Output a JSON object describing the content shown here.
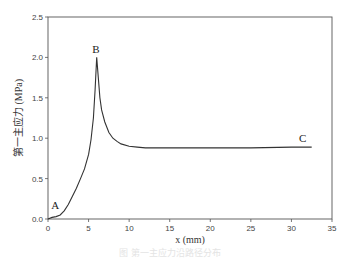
{
  "chart_data": {
    "type": "line",
    "title": "",
    "xlabel": "x (mm)",
    "ylabel": "第一主应力 (MPa)",
    "xlim": [
      0,
      35
    ],
    "ylim": [
      0,
      2.5
    ],
    "xticks": [
      0,
      5,
      10,
      15,
      20,
      25,
      30,
      35
    ],
    "yticks": [
      0.0,
      0.5,
      1.0,
      1.5,
      2.0,
      2.5
    ],
    "xtick_labels": [
      "0",
      "5",
      "10",
      "15",
      "20",
      "25",
      "30",
      "35"
    ],
    "ytick_labels": [
      "0.0",
      "0.5",
      "1.0",
      "1.5",
      "2.0",
      "2.5"
    ],
    "grid": false,
    "legend": null,
    "series": [
      {
        "name": "first principal stress",
        "x": [
          0,
          0.5,
          1.0,
          1.5,
          2.0,
          2.5,
          3.0,
          3.5,
          4.0,
          4.5,
          5.0,
          5.3,
          5.6,
          5.8,
          6.0,
          6.2,
          6.4,
          6.6,
          7.0,
          7.5,
          8.0,
          8.5,
          9.0,
          10.0,
          11.0,
          12.0,
          14.0,
          16.0,
          20.0,
          25.0,
          30.0,
          32.5
        ],
        "y": [
          0.0,
          0.02,
          0.03,
          0.05,
          0.1,
          0.18,
          0.28,
          0.38,
          0.5,
          0.62,
          0.8,
          0.98,
          1.25,
          1.6,
          2.0,
          1.75,
          1.5,
          1.35,
          1.2,
          1.07,
          1.0,
          0.96,
          0.93,
          0.9,
          0.89,
          0.88,
          0.88,
          0.88,
          0.88,
          0.88,
          0.89,
          0.89
        ],
        "color": "#333333"
      }
    ],
    "annotations": [
      {
        "text": "A",
        "x": 0.9,
        "y": 0.12
      },
      {
        "text": "B",
        "x": 5.9,
        "y": 2.06
      },
      {
        "text": "C",
        "x": 31.4,
        "y": 0.95
      }
    ]
  },
  "caption": "图 第一主应力沿路径分布"
}
